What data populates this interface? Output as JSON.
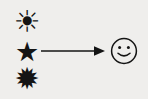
{
  "diagram": {
    "background_color": "#efeeec",
    "ink_color": "#141414",
    "sources": [
      {
        "id": "sun",
        "glyph": "☀",
        "icon_name": "sun-outline-icon",
        "label": ""
      },
      {
        "id": "star",
        "glyph": "★",
        "icon_name": "black-star-icon",
        "label": ""
      },
      {
        "id": "burst",
        "glyph": "✹",
        "icon_name": "twelve-point-burst-icon",
        "label": ""
      }
    ],
    "connector": {
      "icon_name": "right-arrow-icon",
      "direction": "right",
      "label": ""
    },
    "target": {
      "id": "smiley",
      "glyph": "☺",
      "icon_name": "smiley-face-icon",
      "label": ""
    }
  }
}
